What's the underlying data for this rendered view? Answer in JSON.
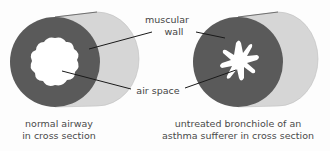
{
  "labels": {
    "muscular_wall_line1": "muscular",
    "muscular_wall_line2": "wall",
    "air_space": "air space"
  },
  "captions": {
    "normal": {
      "line1": "normal airway",
      "line2": "in cross section"
    },
    "asthma": {
      "line1": "untreated bronchiole of an",
      "line2": "asthma sufferer in cross section"
    }
  },
  "colors": {
    "wall": "#5a5a5a",
    "tube_side": "#d6d6d6",
    "air": "#ffffff",
    "line": "#1a1a1a"
  }
}
